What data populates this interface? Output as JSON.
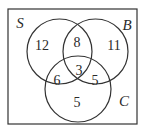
{
  "diagram": {
    "type": "venn-3",
    "universe": {
      "x": 8,
      "y": 9,
      "width": 129,
      "height": 115
    },
    "stroke_color": "#333333",
    "sets": [
      {
        "id": "S",
        "label": "S",
        "cx": 59.5,
        "cy": 51.5,
        "r": 32.5,
        "label_x": 20,
        "label_y": 28
      },
      {
        "id": "B",
        "label": "B",
        "cx": 95.5,
        "cy": 51.5,
        "r": 32.5,
        "label_x": 127,
        "label_y": 30
      },
      {
        "id": "C",
        "label": "C",
        "cx": 78,
        "cy": 89,
        "r": 33,
        "label_x": 124,
        "label_y": 106
      }
    ],
    "regions": [
      {
        "id": "S_only",
        "value": "12",
        "x": 42,
        "y": 50
      },
      {
        "id": "S_and_B_only",
        "value": "8",
        "x": 77,
        "y": 47
      },
      {
        "id": "B_only",
        "value": "11",
        "x": 114,
        "y": 50
      },
      {
        "id": "S_and_B_and_C",
        "value": "3",
        "x": 79,
        "y": 75
      },
      {
        "id": "S_and_C_only",
        "value": "6",
        "x": 57,
        "y": 85
      },
      {
        "id": "B_and_C_only",
        "value": "5",
        "x": 95,
        "y": 85
      },
      {
        "id": "C_only",
        "value": "5",
        "x": 77,
        "y": 107
      }
    ]
  }
}
